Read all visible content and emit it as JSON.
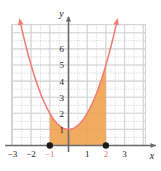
{
  "chart_data": {
    "type": "line",
    "title": "",
    "xlabel": "x",
    "ylabel": "y",
    "grid": true,
    "grid_major_step": 1,
    "grid_minor_step": 0.5,
    "xlim": [
      -3.7,
      3.7
    ],
    "ylim": [
      -0.6,
      7.6
    ],
    "xticks": [
      -3,
      -2,
      -1,
      1,
      2,
      3
    ],
    "xtick_labels": [
      "−3",
      "−2",
      "−1",
      "1",
      "2",
      "3"
    ],
    "xtick_label_colors": [
      "#1a1a1a",
      "#1a1a1a",
      "#e8736a",
      "#1a1a1a",
      "#e8736a",
      "#1a1a1a"
    ],
    "yticks": [
      1,
      2,
      3,
      4,
      5,
      6
    ],
    "ytick_labels": [
      "1",
      "2",
      "3",
      "4",
      "5",
      "6"
    ],
    "curve": {
      "label": "",
      "equation": "y = x^2 + 1",
      "color": "#ef7b72",
      "vertex": [
        0,
        1
      ],
      "arrow_start": true,
      "arrow_end": true,
      "x_start": -2.55,
      "x_end": 2.55
    },
    "shaded_region": {
      "fill_color": "#f0a04b",
      "x_from": -1,
      "x_to": 2,
      "upper": "y = x^2 + 1",
      "lower": "y = 0"
    },
    "points": [
      {
        "x": -1,
        "y": 0,
        "color": "#1a1a1a",
        "style": "filled-dot"
      },
      {
        "x": 2,
        "y": 0,
        "color": "#1a1a1a",
        "style": "filled-dot"
      }
    ],
    "axis_color": "#6b6b6b",
    "grid_major_color": "#d4d4d4",
    "grid_minor_color": "#b9b9b9"
  },
  "figure": {
    "y_axis_label": "y",
    "x_axis_label": "x"
  }
}
